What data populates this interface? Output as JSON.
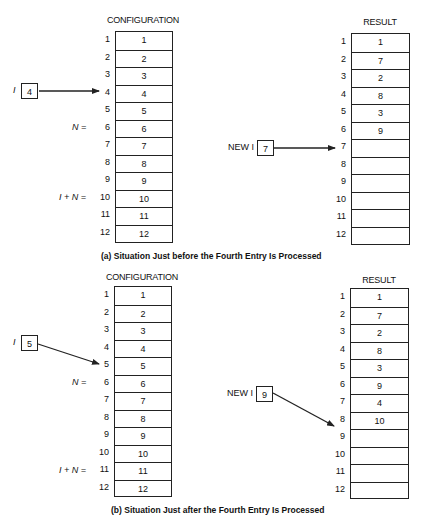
{
  "panels": [
    {
      "id": "a",
      "caption": "(a) Situation Just before the Fourth Entry Is Processed",
      "configuration": {
        "title": "CONFIGURATION",
        "indices": [
          "1",
          "2",
          "3",
          "4",
          "5",
          "6",
          "7",
          "8",
          "9",
          "10",
          "11",
          "12"
        ],
        "values": [
          "1",
          "2",
          "3",
          "4",
          "5",
          "6",
          "7",
          "8",
          "9",
          "10",
          "11",
          "12"
        ]
      },
      "result": {
        "title": "RESULT",
        "indices": [
          "1",
          "2",
          "3",
          "4",
          "5",
          "6",
          "7",
          "8",
          "9",
          "10",
          "11",
          "12"
        ],
        "values": [
          "1",
          "7",
          "2",
          "8",
          "3",
          "9",
          "",
          "",
          "",
          "",
          "",
          ""
        ]
      },
      "pointer_i": {
        "label": "I",
        "value": "4",
        "points_to_index": "4"
      },
      "pointer_new_i": {
        "label": "NEW I",
        "value": "7",
        "points_to_index": "7"
      },
      "markers": {
        "n_label": "N =",
        "n_row": "6",
        "i_plus_n_label": "I + N =",
        "i_plus_n_row": "10"
      }
    },
    {
      "id": "b",
      "caption": "(b) Situation Just after the Fourth Entry Is Processed",
      "configuration": {
        "title": "CONFIGURATION",
        "indices": [
          "1",
          "2",
          "3",
          "4",
          "5",
          "6",
          "7",
          "8",
          "9",
          "10",
          "11",
          "12"
        ],
        "values": [
          "1",
          "2",
          "3",
          "4",
          "5",
          "6",
          "7",
          "8",
          "9",
          "10",
          "11",
          "12"
        ]
      },
      "result": {
        "title": "RESULT",
        "indices": [
          "1",
          "2",
          "3",
          "4",
          "5",
          "6",
          "7",
          "8",
          "9",
          "10",
          "11",
          "12"
        ],
        "values": [
          "1",
          "7",
          "2",
          "8",
          "3",
          "9",
          "4",
          "10",
          "",
          "",
          "",
          ""
        ]
      },
      "pointer_i": {
        "label": "I",
        "value": "5",
        "points_to_index": "5"
      },
      "pointer_new_i": {
        "label": "NEW I",
        "value": "9",
        "points_to_index": "9"
      },
      "markers": {
        "n_label": "N =",
        "n_row": "6",
        "i_plus_n_label": "I + N =",
        "i_plus_n_row": "11"
      }
    }
  ]
}
